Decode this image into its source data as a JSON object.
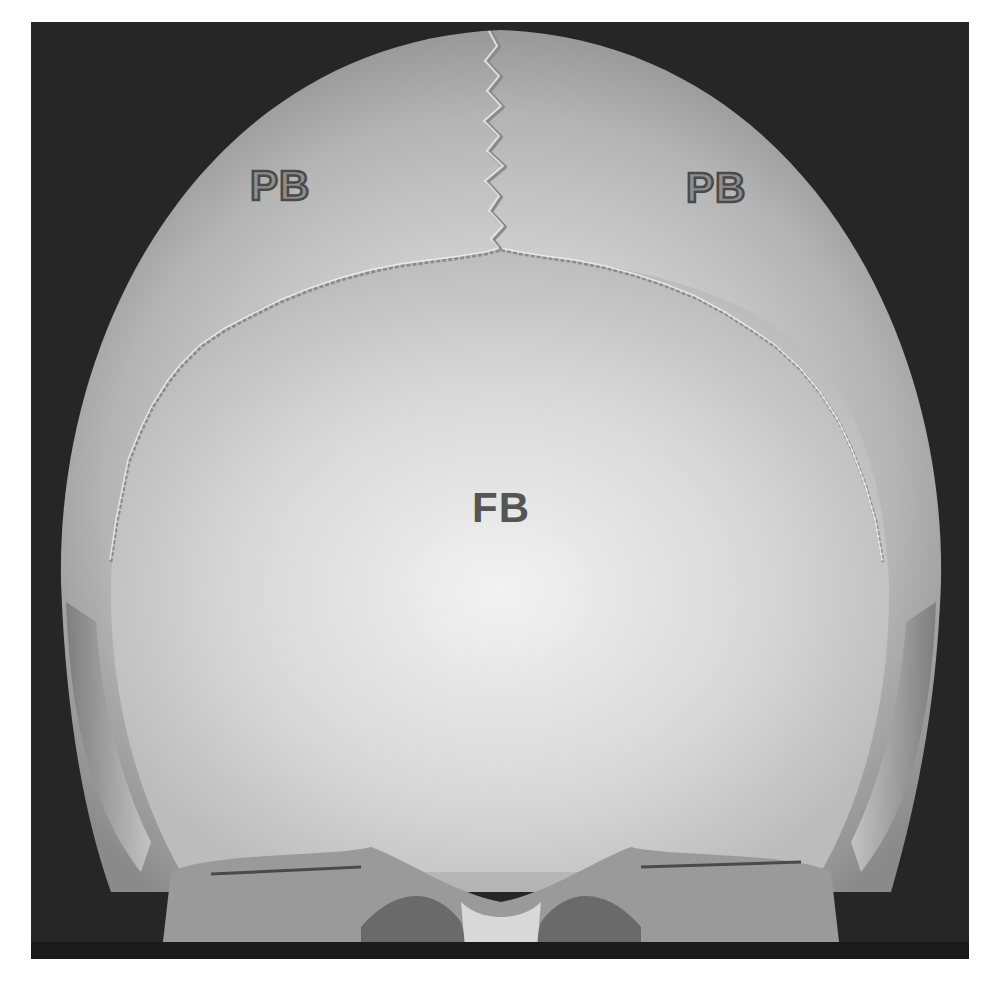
{
  "image": {
    "description": "3D CT volume rendering of a skull, frontal/superior view showing sutures",
    "frame_color": "#262626",
    "background_color": "#ffffff",
    "bone_color_light": "#e6e6e6",
    "bone_color_mid": "#a8a8a8",
    "bone_color_dark": "#6e6e6e"
  },
  "labels": [
    {
      "id": "pb-left",
      "text": "PB",
      "x": 250,
      "y": 165
    },
    {
      "id": "pb-right",
      "text": "PB",
      "x": 686,
      "y": 167
    },
    {
      "id": "fb-center",
      "text": "FB",
      "x": 472,
      "y": 487
    }
  ]
}
